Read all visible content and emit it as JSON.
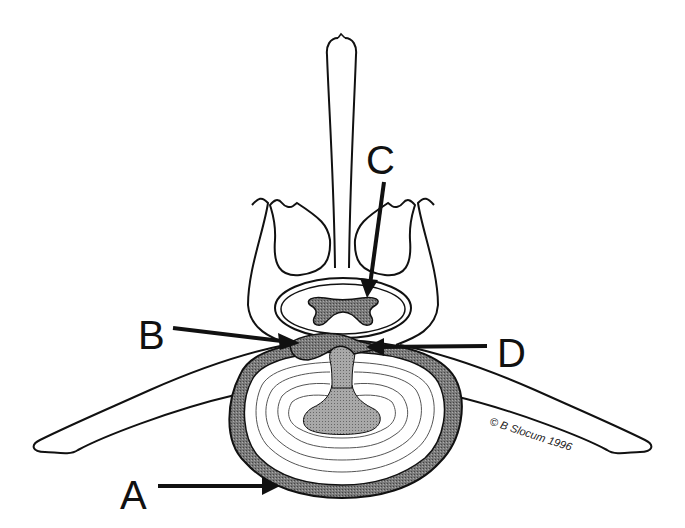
{
  "diagram": {
    "labels": [
      {
        "id": "A",
        "text": "A",
        "points_to": "annulus outer ring (shaded)"
      },
      {
        "id": "B",
        "text": "B",
        "points_to": "herniated disc material (dark shaded)"
      },
      {
        "id": "C",
        "text": "C",
        "points_to": "spinal canal"
      },
      {
        "id": "D",
        "text": "D",
        "points_to": "nucleus extrusion (light shaded)"
      }
    ],
    "copyright": "© B Slocum 1996",
    "colors": {
      "line": "#111111",
      "dark_fill": "#6e6e6e",
      "mid_fill": "#9a9a9a",
      "light_fill": "#b8b8b8",
      "background": "#ffffff"
    }
  }
}
